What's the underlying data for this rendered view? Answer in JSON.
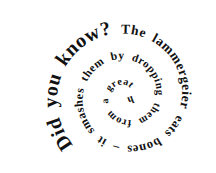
{
  "figure": {
    "full_text": "Did you know? The lammergeier eats bones – it smashes them by dropping them from a great height.",
    "segments": [
      "Did you know? ",
      "The lammergeier ",
      "eats bones ",
      "– it smashes ",
      "them by ",
      "dropping ",
      "them from ",
      "a great ",
      "height."
    ],
    "text_color": "#111111",
    "background_color": "#ffffff"
  }
}
